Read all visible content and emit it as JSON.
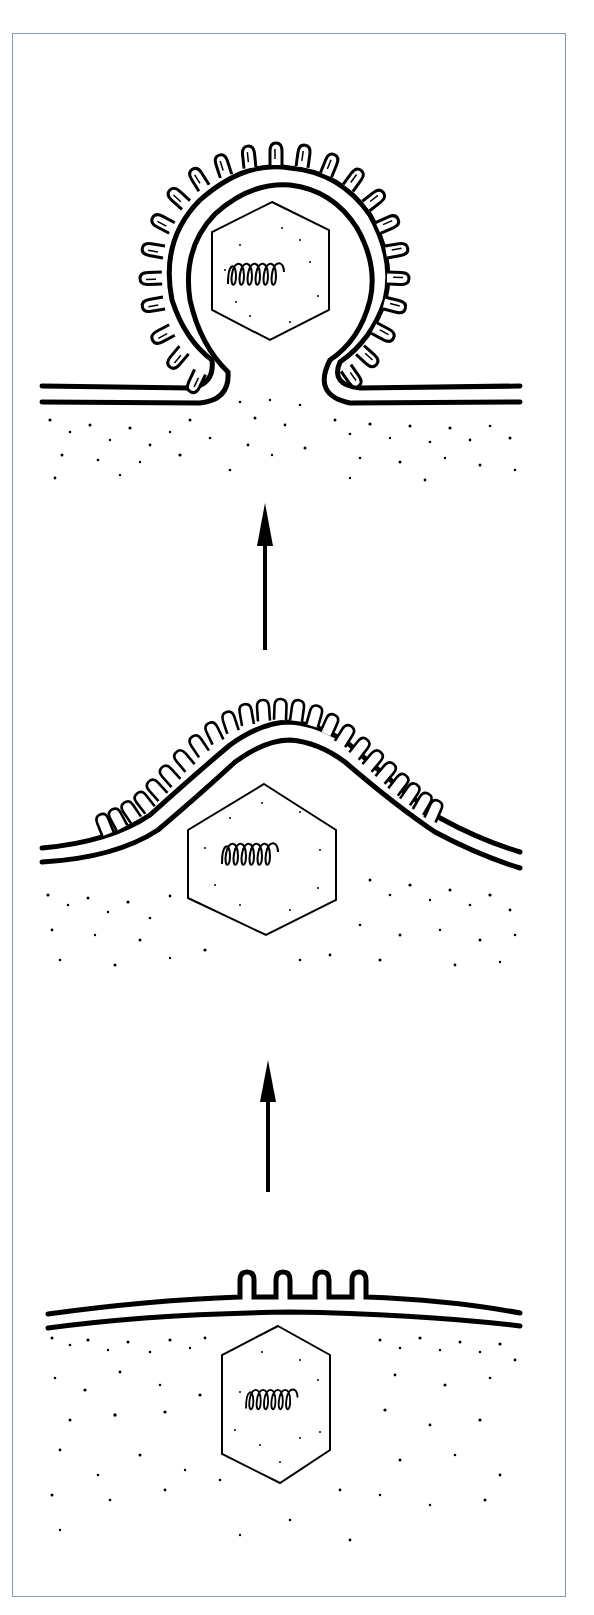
{
  "figure": {
    "frame_color": "#8a93c4",
    "ink_color": "#000000",
    "stages": [
      {
        "id": "stage-1",
        "label": "Glycoprotein spikes inserted into flat host membrane; capsid beneath",
        "spike_count": 4
      },
      {
        "id": "stage-2",
        "label": "Membrane arches over capsid, densely studded with spikes",
        "spike_count": 26
      },
      {
        "id": "stage-3",
        "label": "Enveloped virion pinching off from membrane",
        "spike_count": 24
      }
    ],
    "arrows": [
      {
        "id": "arrow-stage1-to-stage2",
        "direction": "up"
      },
      {
        "id": "arrow-stage2-to-stage3",
        "direction": "up"
      }
    ],
    "components": {
      "capsid_shape": "hexagon",
      "genome_shape": "coil"
    }
  },
  "caption": {
    "text": ""
  }
}
